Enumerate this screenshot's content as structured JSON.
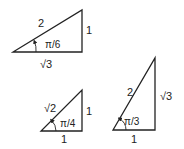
{
  "diagram": {
    "triangles": [
      {
        "id": "pi-over-6",
        "angle_label": "π/6",
        "hypotenuse_label": "2",
        "opposite_label": "1",
        "adjacent_label": "√3",
        "vertices": {
          "A": [
            13,
            52
          ],
          "B": [
            82,
            52
          ],
          "C": [
            82,
            10
          ]
        }
      },
      {
        "id": "pi-over-4",
        "angle_label": "π/4",
        "hypotenuse_label": "√2",
        "opposite_label": "1",
        "adjacent_label": "1",
        "vertices": {
          "A": [
            41,
            131
          ],
          "B": [
            82,
            131
          ],
          "C": [
            82,
            90
          ]
        }
      },
      {
        "id": "pi-over-3",
        "angle_label": "π/3",
        "hypotenuse_label": "2",
        "opposite_label": "√3",
        "adjacent_label": "1",
        "vertices": {
          "A": [
            113,
            130
          ],
          "B": [
            155,
            130
          ],
          "C": [
            155,
            58
          ]
        }
      }
    ],
    "colors": {
      "stroke": "#222222",
      "background": "#ffffff"
    }
  }
}
